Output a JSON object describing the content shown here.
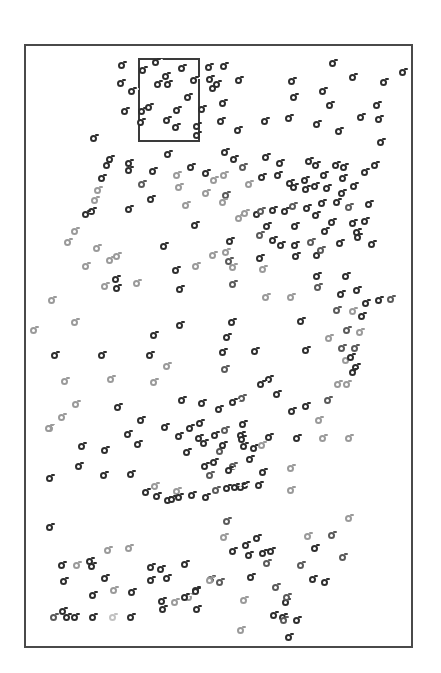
{
  "figure": {
    "background": "#ffffff",
    "frame": {
      "left": 24,
      "top": 44,
      "right": 413,
      "bottom": 648,
      "color": "#4a4a4a"
    },
    "inset_box": {
      "left": 138,
      "top": 58,
      "right": 200,
      "bottom": 142,
      "color": "#3a3a3a"
    },
    "shades": {
      "dark": "#2e2e2e",
      "mid": "#5a5a5a",
      "light": "#9a9a9a",
      "faint": "#c2c2c2"
    }
  },
  "chart_data": {
    "type": "scatter",
    "title": "",
    "xlabel": "",
    "ylabel": "",
    "grid": false,
    "legend": null,
    "note": "Unlabeled stipple scatter of ring markers; coordinates are screenshot pixels (x right, y down); shade d=dark, m=mid, l=light, f=faint.",
    "points": [
      [
        121,
        65,
        "d"
      ],
      [
        155,
        62,
        "d"
      ],
      [
        142,
        70,
        "d"
      ],
      [
        181,
        68,
        "d"
      ],
      [
        208,
        67,
        "d"
      ],
      [
        223,
        66,
        "d"
      ],
      [
        332,
        63,
        "d"
      ],
      [
        402,
        72,
        "d"
      ],
      [
        120,
        83,
        "d"
      ],
      [
        165,
        76,
        "d"
      ],
      [
        193,
        80,
        "d"
      ],
      [
        209,
        79,
        "d"
      ],
      [
        212,
        88,
        "d"
      ],
      [
        216,
        84,
        "d"
      ],
      [
        238,
        80,
        "d"
      ],
      [
        291,
        81,
        "d"
      ],
      [
        352,
        77,
        "d"
      ],
      [
        383,
        82,
        "d"
      ],
      [
        131,
        91,
        "d"
      ],
      [
        157,
        84,
        "d"
      ],
      [
        167,
        84,
        "d"
      ],
      [
        187,
        97,
        "d"
      ],
      [
        222,
        103,
        "d"
      ],
      [
        293,
        97,
        "d"
      ],
      [
        322,
        91,
        "d"
      ],
      [
        329,
        105,
        "d"
      ],
      [
        376,
        105,
        "d"
      ],
      [
        124,
        111,
        "d"
      ],
      [
        141,
        111,
        "d"
      ],
      [
        148,
        107,
        "d"
      ],
      [
        176,
        110,
        "d"
      ],
      [
        201,
        109,
        "d"
      ],
      [
        220,
        121,
        "d"
      ],
      [
        237,
        130,
        "d"
      ],
      [
        264,
        121,
        "d"
      ],
      [
        288,
        118,
        "d"
      ],
      [
        316,
        124,
        "d"
      ],
      [
        338,
        131,
        "d"
      ],
      [
        360,
        117,
        "d"
      ],
      [
        378,
        119,
        "d"
      ],
      [
        140,
        122,
        "d"
      ],
      [
        166,
        120,
        "d"
      ],
      [
        175,
        127,
        "d"
      ],
      [
        196,
        126,
        "d"
      ],
      [
        196,
        135,
        "d"
      ],
      [
        380,
        142,
        "d"
      ],
      [
        93,
        138,
        "d"
      ],
      [
        167,
        154,
        "d"
      ],
      [
        224,
        152,
        "d"
      ],
      [
        233,
        159,
        "d"
      ],
      [
        265,
        157,
        "d"
      ],
      [
        279,
        163,
        "d"
      ],
      [
        308,
        161,
        "d"
      ],
      [
        315,
        165,
        "d"
      ],
      [
        335,
        165,
        "d"
      ],
      [
        343,
        167,
        "d"
      ],
      [
        374,
        165,
        "d"
      ],
      [
        109,
        159,
        "d"
      ],
      [
        106,
        165,
        "d"
      ],
      [
        128,
        163,
        "d"
      ],
      [
        128,
        170,
        "d"
      ],
      [
        152,
        171,
        "d"
      ],
      [
        176,
        175,
        "l"
      ],
      [
        190,
        167,
        "d"
      ],
      [
        205,
        173,
        "d"
      ],
      [
        213,
        180,
        "l"
      ],
      [
        223,
        175,
        "l"
      ],
      [
        242,
        167,
        "m"
      ],
      [
        261,
        177,
        "d"
      ],
      [
        277,
        175,
        "d"
      ],
      [
        289,
        183,
        "d"
      ],
      [
        304,
        180,
        "d"
      ],
      [
        323,
        175,
        "d"
      ],
      [
        342,
        178,
        "d"
      ],
      [
        364,
        172,
        "d"
      ],
      [
        101,
        178,
        "d"
      ],
      [
        97,
        190,
        "l"
      ],
      [
        141,
        184,
        "m"
      ],
      [
        150,
        199,
        "d"
      ],
      [
        178,
        187,
        "l"
      ],
      [
        205,
        193,
        "l"
      ],
      [
        225,
        195,
        "m"
      ],
      [
        248,
        184,
        "l"
      ],
      [
        293,
        187,
        "d"
      ],
      [
        305,
        189,
        "d"
      ],
      [
        314,
        186,
        "d"
      ],
      [
        326,
        188,
        "d"
      ],
      [
        341,
        193,
        "d"
      ],
      [
        353,
        186,
        "d"
      ],
      [
        94,
        200,
        "l"
      ],
      [
        91,
        211,
        "d"
      ],
      [
        128,
        209,
        "d"
      ],
      [
        185,
        205,
        "l"
      ],
      [
        222,
        202,
        "l"
      ],
      [
        238,
        218,
        "l"
      ],
      [
        244,
        213,
        "l"
      ],
      [
        256,
        214,
        "d"
      ],
      [
        260,
        211,
        "m"
      ],
      [
        272,
        210,
        "d"
      ],
      [
        284,
        211,
        "d"
      ],
      [
        292,
        206,
        "m"
      ],
      [
        306,
        208,
        "d"
      ],
      [
        315,
        215,
        "d"
      ],
      [
        321,
        203,
        "d"
      ],
      [
        336,
        202,
        "d"
      ],
      [
        348,
        207,
        "m"
      ],
      [
        368,
        204,
        "d"
      ],
      [
        85,
        214,
        "d"
      ],
      [
        74,
        231,
        "l"
      ],
      [
        67,
        242,
        "l"
      ],
      [
        96,
        248,
        "l"
      ],
      [
        109,
        260,
        "l"
      ],
      [
        116,
        256,
        "l"
      ],
      [
        163,
        246,
        "d"
      ],
      [
        194,
        225,
        "d"
      ],
      [
        229,
        241,
        "d"
      ],
      [
        259,
        235,
        "m"
      ],
      [
        266,
        226,
        "d"
      ],
      [
        272,
        240,
        "d"
      ],
      [
        294,
        226,
        "d"
      ],
      [
        324,
        231,
        "d"
      ],
      [
        331,
        222,
        "d"
      ],
      [
        352,
        223,
        "d"
      ],
      [
        356,
        232,
        "d"
      ],
      [
        364,
        221,
        "d"
      ],
      [
        85,
        266,
        "l"
      ],
      [
        104,
        286,
        "l"
      ],
      [
        116,
        288,
        "d"
      ],
      [
        136,
        283,
        "l"
      ],
      [
        175,
        270,
        "d"
      ],
      [
        195,
        266,
        "l"
      ],
      [
        212,
        255,
        "l"
      ],
      [
        225,
        252,
        "l"
      ],
      [
        232,
        267,
        "l"
      ],
      [
        259,
        258,
        "d"
      ],
      [
        280,
        245,
        "d"
      ],
      [
        294,
        245,
        "d"
      ],
      [
        295,
        256,
        "d"
      ],
      [
        310,
        242,
        "m"
      ],
      [
        316,
        255,
        "d"
      ],
      [
        320,
        250,
        "m"
      ],
      [
        339,
        243,
        "d"
      ],
      [
        357,
        237,
        "d"
      ],
      [
        371,
        244,
        "d"
      ],
      [
        51,
        300,
        "l"
      ],
      [
        74,
        322,
        "l"
      ],
      [
        33,
        330,
        "l"
      ],
      [
        115,
        279,
        "d"
      ],
      [
        179,
        289,
        "d"
      ],
      [
        228,
        261,
        "m"
      ],
      [
        232,
        284,
        "m"
      ],
      [
        262,
        269,
        "l"
      ],
      [
        290,
        297,
        "l"
      ],
      [
        316,
        276,
        "d"
      ],
      [
        317,
        287,
        "m"
      ],
      [
        340,
        294,
        "d"
      ],
      [
        345,
        276,
        "d"
      ],
      [
        356,
        290,
        "d"
      ],
      [
        365,
        303,
        "d"
      ],
      [
        378,
        300,
        "d"
      ],
      [
        390,
        299,
        "m"
      ],
      [
        153,
        335,
        "d"
      ],
      [
        179,
        325,
        "d"
      ],
      [
        231,
        322,
        "d"
      ],
      [
        265,
        297,
        "l"
      ],
      [
        300,
        321,
        "d"
      ],
      [
        336,
        310,
        "m"
      ],
      [
        346,
        330,
        "m"
      ],
      [
        352,
        311,
        "l"
      ],
      [
        361,
        316,
        "d"
      ],
      [
        359,
        332,
        "l"
      ],
      [
        354,
        348,
        "m"
      ],
      [
        54,
        355,
        "d"
      ],
      [
        101,
        355,
        "d"
      ],
      [
        149,
        355,
        "d"
      ],
      [
        166,
        366,
        "l"
      ],
      [
        226,
        337,
        "d"
      ],
      [
        222,
        352,
        "d"
      ],
      [
        254,
        351,
        "d"
      ],
      [
        268,
        379,
        "d"
      ],
      [
        305,
        350,
        "d"
      ],
      [
        328,
        338,
        "l"
      ],
      [
        341,
        348,
        "m"
      ],
      [
        345,
        360,
        "l"
      ],
      [
        350,
        357,
        "d"
      ],
      [
        355,
        367,
        "d"
      ],
      [
        64,
        381,
        "l"
      ],
      [
        110,
        379,
        "l"
      ],
      [
        153,
        382,
        "l"
      ],
      [
        201,
        403,
        "d"
      ],
      [
        224,
        369,
        "m"
      ],
      [
        241,
        398,
        "m"
      ],
      [
        260,
        384,
        "d"
      ],
      [
        276,
        394,
        "d"
      ],
      [
        305,
        406,
        "d"
      ],
      [
        318,
        420,
        "l"
      ],
      [
        327,
        400,
        "m"
      ],
      [
        337,
        384,
        "l"
      ],
      [
        346,
        384,
        "l"
      ],
      [
        352,
        372,
        "d"
      ],
      [
        75,
        404,
        "l"
      ],
      [
        61,
        417,
        "l"
      ],
      [
        49,
        428,
        "l"
      ],
      [
        117,
        407,
        "d"
      ],
      [
        140,
        420,
        "d"
      ],
      [
        181,
        400,
        "d"
      ],
      [
        189,
        428,
        "d"
      ],
      [
        199,
        423,
        "d"
      ],
      [
        218,
        409,
        "d"
      ],
      [
        232,
        402,
        "d"
      ],
      [
        253,
        448,
        "d"
      ],
      [
        291,
        411,
        "d"
      ],
      [
        48,
        428,
        "l"
      ],
      [
        81,
        446,
        "d"
      ],
      [
        127,
        434,
        "d"
      ],
      [
        137,
        444,
        "d"
      ],
      [
        154,
        486,
        "l"
      ],
      [
        164,
        427,
        "d"
      ],
      [
        178,
        436,
        "d"
      ],
      [
        186,
        452,
        "d"
      ],
      [
        198,
        438,
        "d"
      ],
      [
        214,
        435,
        "d"
      ],
      [
        203,
        443,
        "d"
      ],
      [
        219,
        451,
        "m"
      ],
      [
        222,
        445,
        "d"
      ],
      [
        242,
        424,
        "d"
      ],
      [
        240,
        435,
        "d"
      ],
      [
        243,
        446,
        "d"
      ],
      [
        232,
        466,
        "m"
      ],
      [
        224,
        430,
        "m"
      ],
      [
        241,
        439,
        "d"
      ],
      [
        49,
        478,
        "d"
      ],
      [
        78,
        466,
        "d"
      ],
      [
        103,
        475,
        "d"
      ],
      [
        130,
        474,
        "d"
      ],
      [
        145,
        492,
        "d"
      ],
      [
        176,
        491,
        "l"
      ],
      [
        204,
        466,
        "d"
      ],
      [
        209,
        475,
        "m"
      ],
      [
        213,
        462,
        "d"
      ],
      [
        228,
        470,
        "d"
      ],
      [
        244,
        485,
        "d"
      ],
      [
        249,
        459,
        "d"
      ],
      [
        262,
        472,
        "d"
      ],
      [
        268,
        437,
        "d"
      ],
      [
        296,
        438,
        "d"
      ],
      [
        322,
        438,
        "l"
      ],
      [
        348,
        438,
        "l"
      ],
      [
        261,
        445,
        "l"
      ],
      [
        290,
        468,
        "l"
      ],
      [
        290,
        490,
        "l"
      ],
      [
        49,
        527,
        "d"
      ],
      [
        104,
        450,
        "d"
      ],
      [
        156,
        496,
        "d"
      ],
      [
        167,
        500,
        "d"
      ],
      [
        171,
        499,
        "d"
      ],
      [
        178,
        497,
        "d"
      ],
      [
        191,
        495,
        "d"
      ],
      [
        205,
        497,
        "d"
      ],
      [
        215,
        490,
        "m"
      ],
      [
        226,
        488,
        "d"
      ],
      [
        240,
        487,
        "d"
      ],
      [
        258,
        485,
        "d"
      ],
      [
        234,
        487,
        "d"
      ],
      [
        61,
        565,
        "d"
      ],
      [
        63,
        581,
        "d"
      ],
      [
        76,
        565,
        "l"
      ],
      [
        89,
        561,
        "d"
      ],
      [
        107,
        550,
        "l"
      ],
      [
        128,
        548,
        "l"
      ],
      [
        104,
        578,
        "d"
      ],
      [
        91,
        566,
        "d"
      ],
      [
        92,
        595,
        "d"
      ],
      [
        113,
        590,
        "l"
      ],
      [
        131,
        592,
        "d"
      ],
      [
        150,
        567,
        "d"
      ],
      [
        150,
        580,
        "d"
      ],
      [
        160,
        569,
        "d"
      ],
      [
        166,
        578,
        "d"
      ],
      [
        184,
        564,
        "d"
      ],
      [
        188,
        597,
        "l"
      ],
      [
        195,
        590,
        "d"
      ],
      [
        210,
        579,
        "m"
      ],
      [
        223,
        537,
        "l"
      ],
      [
        226,
        521,
        "m"
      ],
      [
        232,
        551,
        "d"
      ],
      [
        245,
        545,
        "d"
      ],
      [
        248,
        555,
        "d"
      ],
      [
        250,
        577,
        "d"
      ],
      [
        256,
        538,
        "d"
      ],
      [
        262,
        553,
        "d"
      ],
      [
        266,
        563,
        "m"
      ],
      [
        270,
        551,
        "d"
      ],
      [
        285,
        602,
        "d"
      ],
      [
        275,
        587,
        "m"
      ],
      [
        286,
        597,
        "m"
      ],
      [
        300,
        565,
        "m"
      ],
      [
        307,
        536,
        "l"
      ],
      [
        312,
        579,
        "d"
      ],
      [
        314,
        548,
        "d"
      ],
      [
        324,
        582,
        "d"
      ],
      [
        331,
        535,
        "m"
      ],
      [
        342,
        557,
        "m"
      ],
      [
        348,
        518,
        "l"
      ],
      [
        53,
        617,
        "m"
      ],
      [
        66,
        617,
        "d"
      ],
      [
        74,
        617,
        "d"
      ],
      [
        92,
        617,
        "d"
      ],
      [
        112,
        617,
        "f"
      ],
      [
        130,
        617,
        "d"
      ],
      [
        62,
        611,
        "d"
      ],
      [
        161,
        601,
        "d"
      ],
      [
        162,
        609,
        "d"
      ],
      [
        174,
        602,
        "l"
      ],
      [
        184,
        597,
        "d"
      ],
      [
        195,
        591,
        "d"
      ],
      [
        196,
        609,
        "d"
      ],
      [
        209,
        580,
        "l"
      ],
      [
        219,
        582,
        "m"
      ],
      [
        240,
        630,
        "l"
      ],
      [
        243,
        600,
        "l"
      ],
      [
        273,
        615,
        "d"
      ],
      [
        282,
        617,
        "d"
      ],
      [
        283,
        620,
        "m"
      ],
      [
        288,
        637,
        "d"
      ],
      [
        296,
        620,
        "d"
      ]
    ]
  }
}
